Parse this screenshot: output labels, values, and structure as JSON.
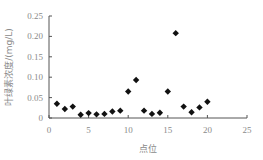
{
  "chart_data": {
    "type": "scatter",
    "title": "",
    "xlabel": "点位",
    "ylabel": "叶绿素浓度/(mg/L)",
    "xlim": [
      0,
      25
    ],
    "ylim": [
      0,
      0.25
    ],
    "xticks": [
      0,
      5,
      10,
      15,
      20,
      25
    ],
    "yticks": [
      0,
      0.05,
      0.1,
      0.15,
      0.2,
      0.25
    ],
    "xtick_labels": [
      "0",
      "5",
      "10",
      "15",
      "20",
      "25"
    ],
    "ytick_labels": [
      "0",
      "0.05",
      "0.10",
      "0.15",
      "0.20",
      "0.25"
    ],
    "grid": false,
    "legend": null,
    "marker": "diamond",
    "marker_color": "#111111",
    "series": [
      {
        "name": "叶绿素浓度",
        "x": [
          1,
          2,
          3,
          4,
          5,
          6,
          7,
          8,
          9,
          10,
          11,
          12,
          13,
          14,
          15,
          16,
          17,
          18,
          19,
          20
        ],
        "y": [
          0.035,
          0.022,
          0.028,
          0.008,
          0.012,
          0.009,
          0.01,
          0.016,
          0.018,
          0.065,
          0.093,
          0.018,
          0.01,
          0.013,
          0.065,
          0.208,
          0.028,
          0.014,
          0.026,
          0.04
        ]
      }
    ]
  }
}
